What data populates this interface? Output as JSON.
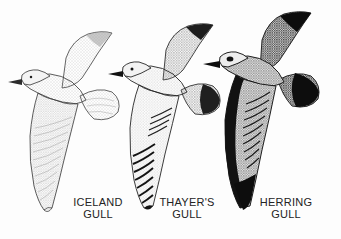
{
  "plate": {
    "background_color": "#fdfdfd",
    "ink_color": "#1a1a1a",
    "label_color": "#232323",
    "subject": "gulls-in-flight-comparison"
  },
  "birds": [
    {
      "id": "iceland",
      "name_line1": "ICELAND",
      "name_line2": "GULL",
      "tone": "palest",
      "wingtip": "pale, unmarked",
      "trailing_edge": "pale",
      "tail_band": "none",
      "stipple_color": "#8d8d8d",
      "outline_color": "#3a3a3a"
    },
    {
      "id": "thayers",
      "name_line1": "THAYER'S",
      "name_line2": "GULL",
      "tone": "intermediate",
      "wingtip": "black and white barred primaries",
      "trailing_edge": "dark",
      "tail_band": "dark",
      "stipple_color": "#595959",
      "outline_color": "#262626"
    },
    {
      "id": "herring",
      "name_line1": "HERRING",
      "name_line2": "GULL",
      "tone": "darkest",
      "wingtip": "solid black",
      "trailing_edge": "solid black",
      "tail_band": "solid black",
      "stipple_color": "#2b2b2b",
      "outline_color": "#141414"
    }
  ]
}
